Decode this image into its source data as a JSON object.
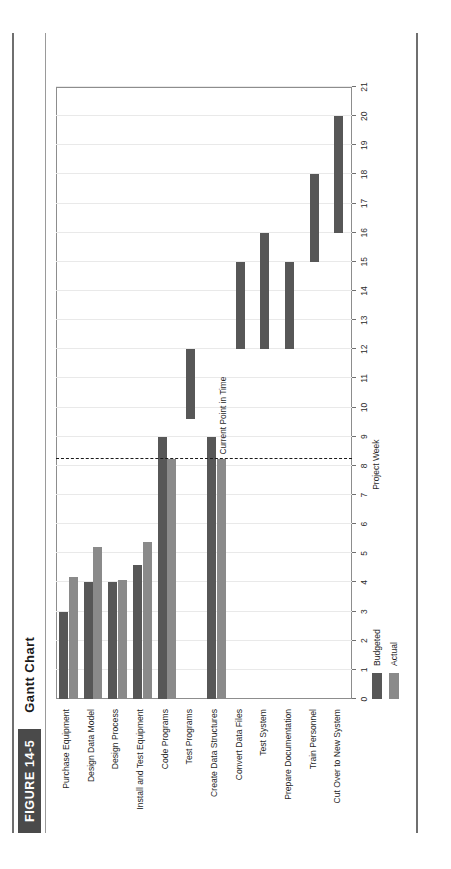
{
  "figure": {
    "badge": "FIGURE 14-5",
    "title": "Gantt Chart"
  },
  "legend": {
    "items": [
      {
        "label": "Budgeted",
        "color": "#575757"
      },
      {
        "label": "Actual",
        "color": "#8a8a8a"
      }
    ]
  },
  "annotation": {
    "current_point_label": "Current Point in Time",
    "current_point_week": 8.25
  },
  "chart_data": {
    "type": "bar",
    "title": "Gantt Chart",
    "xlabel": "Project Week",
    "ylabel": "",
    "xlim": [
      0,
      21
    ],
    "xticks": [
      0,
      1,
      2,
      3,
      4,
      5,
      6,
      7,
      8,
      9,
      10,
      11,
      12,
      13,
      14,
      15,
      16,
      17,
      18,
      19,
      20,
      21
    ],
    "grid": true,
    "legend_position": "bottom-left",
    "orientation": "horizontal",
    "categories": [
      "Purchase Equipment",
      "Design Data Model",
      "Design Process",
      "Install and Test Equipment",
      "Code Programs",
      "Test Programs",
      "Create Data Structures",
      "Convert Data Files",
      "Test System",
      "Prepare Documentation",
      "Train Personnel",
      "Cut Over to New System"
    ],
    "series": [
      {
        "name": "Budgeted",
        "color": "#575757",
        "spans": [
          [
            0,
            3
          ],
          [
            0,
            4
          ],
          [
            0,
            4
          ],
          [
            0,
            4.6
          ],
          [
            0,
            9
          ],
          [
            9.6,
            12
          ],
          [
            0,
            9
          ],
          [
            12,
            15
          ],
          [
            12,
            16
          ],
          [
            12,
            15
          ],
          [
            15,
            18
          ],
          [
            16,
            20
          ]
        ]
      },
      {
        "name": "Actual",
        "color": "#8a8a8a",
        "spans": [
          [
            0,
            4.2
          ],
          [
            0,
            5.2
          ],
          [
            0,
            4.1
          ],
          [
            0,
            5.4
          ],
          [
            0,
            8.25
          ],
          [
            null,
            null
          ],
          [
            0,
            8.25
          ],
          [
            null,
            null
          ],
          [
            null,
            null
          ],
          [
            null,
            null
          ],
          [
            null,
            null
          ],
          [
            null,
            null
          ]
        ]
      }
    ]
  }
}
